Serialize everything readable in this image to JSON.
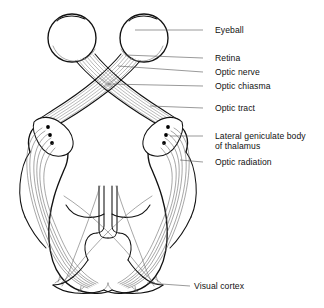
{
  "figure": {
    "width": 324,
    "height": 308,
    "background": "#ffffff",
    "ink_color": "#111111",
    "fiber_color": "#8d8d8d",
    "leader_color": "#555555"
  },
  "labels": [
    {
      "id": "eyeball",
      "text": "Eyeball",
      "x": 215,
      "y": 25,
      "leader_y": 30,
      "leader_x1": 203,
      "leader_x2": 135,
      "target": "eyeball"
    },
    {
      "id": "retina",
      "text": "Retina",
      "x": 215,
      "y": 53,
      "leader_y": 58,
      "leader_x1": 203,
      "leader_x2": 125,
      "target": "retina"
    },
    {
      "id": "optic-nerve",
      "text": "Optic nerve",
      "x": 215,
      "y": 67,
      "leader_y": 72,
      "leader_x1": 203,
      "leader_x2": 118,
      "target": "optic-nerve"
    },
    {
      "id": "optic-chiasma",
      "text": "Optic chiasma",
      "x": 215,
      "y": 81,
      "leader_y": 86,
      "leader_x1": 203,
      "leader_x2": 108,
      "target": "optic-chiasma"
    },
    {
      "id": "optic-tract",
      "text": "Optic tract",
      "x": 215,
      "y": 103,
      "leader_y": 108,
      "leader_x1": 203,
      "leader_x2": 150,
      "target": "optic-tract"
    },
    {
      "id": "lateral-geniculate",
      "text": "Lateral geniculate body",
      "x": 215,
      "y": 131,
      "leader_y": 136,
      "leader_x1": 203,
      "leader_x2": 166,
      "target": "lateral-geniculate-body"
    },
    {
      "id": "lateral-geniculate-line2",
      "text": "of thalamus",
      "x": 215,
      "y": 141,
      "leader_y": null,
      "leader_x1": null,
      "leader_x2": null,
      "target": null
    },
    {
      "id": "optic-radiation",
      "text": "Optic radiation",
      "x": 215,
      "y": 157,
      "leader_y": 162,
      "leader_x1": 203,
      "leader_x2": 176,
      "target": "optic-radiation"
    },
    {
      "id": "visual-cortex",
      "text": "Visual cortex",
      "x": 194,
      "y": 281,
      "leader_y": 286,
      "leader_x1": 190,
      "leader_x2": 147,
      "target": "visual-cortex"
    }
  ],
  "structures": [
    {
      "id": "eyeball-left",
      "name": "Eyeball (left)"
    },
    {
      "id": "eyeball-right",
      "name": "Eyeball (right)"
    },
    {
      "id": "retina",
      "name": "Retina"
    },
    {
      "id": "optic-nerve-left",
      "name": "Optic nerve (left)"
    },
    {
      "id": "optic-nerve-right",
      "name": "Optic nerve (right)"
    },
    {
      "id": "optic-chiasma",
      "name": "Optic chiasma"
    },
    {
      "id": "optic-tract-left",
      "name": "Optic tract (left)"
    },
    {
      "id": "optic-tract-right",
      "name": "Optic tract (right)"
    },
    {
      "id": "lateral-geniculate-left",
      "name": "Lateral geniculate body (left)"
    },
    {
      "id": "lateral-geniculate-right",
      "name": "Lateral geniculate body (right)"
    },
    {
      "id": "optic-radiation-left",
      "name": "Optic radiation (left)"
    },
    {
      "id": "optic-radiation-right",
      "name": "Optic radiation (right)"
    },
    {
      "id": "visual-cortex",
      "name": "Visual cortex"
    },
    {
      "id": "cerebral-hemispheres",
      "name": "Cerebral hemispheres outline"
    },
    {
      "id": "lateral-ventricles",
      "name": "Lateral ventricles"
    }
  ]
}
